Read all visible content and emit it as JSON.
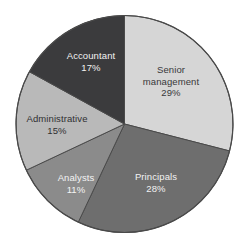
{
  "chart_data": {
    "type": "pie",
    "title": "",
    "subtitle": "",
    "xlabel": "",
    "ylabel": "",
    "legend_position": "none",
    "grid": false,
    "value_suffix": "%",
    "start_angle_deg": 0,
    "direction": "clockwise",
    "background_color": "#ffffff",
    "outline_color": "#4a4a4a",
    "categories": [
      "Senior management",
      "Principals",
      "Analysts",
      "Administrative",
      "Accountant"
    ],
    "values": [
      29,
      28,
      11,
      15,
      17
    ],
    "slices": [
      {
        "label": "Senior management",
        "label_line1": "Senior",
        "label_line2": "management",
        "value": 29,
        "value_text": "29%",
        "color": "#d6d6d6",
        "text_color": "#38383a"
      },
      {
        "label": "Principals",
        "label_line1": "Principals",
        "label_line2": "",
        "value": 28,
        "value_text": "28%",
        "color": "#6e6e6e",
        "text_color": "#f2f2f2"
      },
      {
        "label": "Analysts",
        "label_line1": "Analysts",
        "label_line2": "",
        "value": 11,
        "value_text": "11%",
        "color": "#8b8b8b",
        "text_color": "#f4f4f4"
      },
      {
        "label": "Administrative",
        "label_line1": "Administrative",
        "label_line2": "",
        "value": 15,
        "value_text": "15%",
        "color": "#b9b9b9",
        "text_color": "#303032"
      },
      {
        "label": "Accountant",
        "label_line1": "Accountant",
        "label_line2": "",
        "value": 17,
        "value_text": "17%",
        "color": "#3b3b3d",
        "text_color": "#f2f2f2"
      }
    ]
  }
}
